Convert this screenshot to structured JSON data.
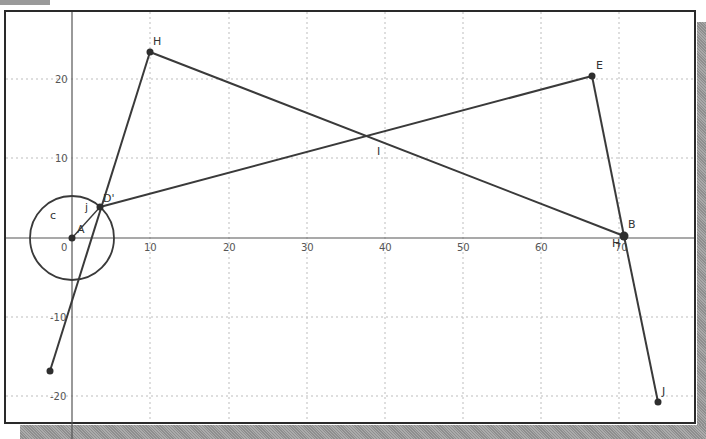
{
  "diagram": {
    "type": "geometry-plot",
    "axes": {
      "x_ticks": [
        "0",
        "10",
        "20",
        "30",
        "40",
        "50",
        "60",
        "70"
      ],
      "y_ticks": [
        "20",
        "10",
        "-10",
        "-20"
      ],
      "origin_label": "0"
    },
    "points": [
      {
        "name": "H",
        "label": "H",
        "x": 10,
        "y": 23.5
      },
      {
        "name": "E",
        "label": "E",
        "x": 66.5,
        "y": 20.5
      },
      {
        "name": "B",
        "label": "B",
        "x": 70.5,
        "y": 0
      },
      {
        "name": "D'",
        "label": "D'",
        "x": 3.5,
        "y": 4
      },
      {
        "name": "A",
        "label": "A",
        "x": 0,
        "y": 0
      },
      {
        "name": "P",
        "label": "",
        "x": -3,
        "y": -17
      },
      {
        "name": "J",
        "label": "J",
        "x": 75,
        "y": -21
      }
    ],
    "segment_labels": {
      "circle": "c",
      "j": "j",
      "i": "I",
      "b_sub": "H"
    },
    "circle": {
      "center": "A",
      "radius": 5.4,
      "label": "c"
    },
    "segments": [
      [
        "P",
        "H"
      ],
      [
        "H",
        "B"
      ],
      [
        "D'",
        "E"
      ],
      [
        "E",
        "B"
      ],
      [
        "B",
        "J"
      ],
      [
        "A",
        "D'"
      ]
    ],
    "colors": {
      "line": "#3a3a3a",
      "point": "#2e2e2e",
      "grid": "#bdbdbd",
      "axis": "#555555",
      "frame": "#2a2a2a",
      "shadow": "#9a9a9a"
    }
  }
}
